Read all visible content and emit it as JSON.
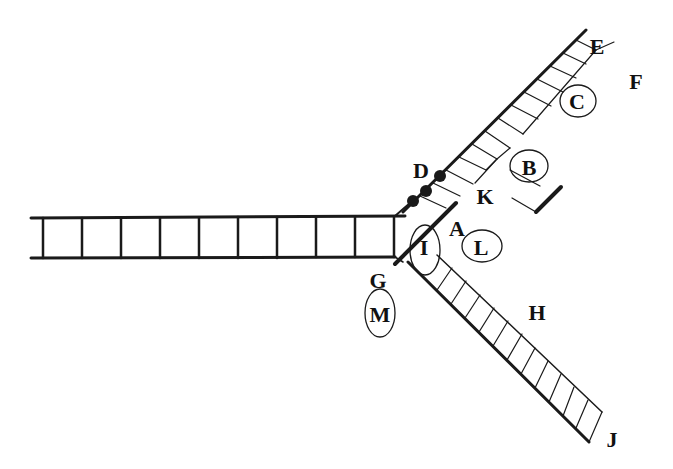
{
  "diagram": {
    "type": "Y-shaped structure diagram with three arms",
    "colors": {
      "line": "#1a1a1a",
      "background": "#ffffff"
    },
    "labels": [
      {
        "id": "A",
        "text": "A",
        "circled": false,
        "x": 457,
        "y": 232
      },
      {
        "id": "B",
        "text": "B",
        "circled": true,
        "x": 529,
        "y": 167
      },
      {
        "id": "C",
        "text": "C",
        "circled": true,
        "x": 577,
        "y": 100
      },
      {
        "id": "D",
        "text": "D",
        "circled": false,
        "x": 421,
        "y": 170
      },
      {
        "id": "E",
        "text": "E",
        "circled": false,
        "x": 596,
        "y": 46
      },
      {
        "id": "F",
        "text": "F",
        "circled": false,
        "x": 636,
        "y": 81
      },
      {
        "id": "G",
        "text": "G",
        "circled": false,
        "x": 377,
        "y": 281
      },
      {
        "id": "H",
        "text": "H",
        "circled": false,
        "x": 537,
        "y": 313
      },
      {
        "id": "I",
        "text": "I",
        "circled": true,
        "x": 424,
        "y": 248
      },
      {
        "id": "J",
        "text": "J",
        "circled": false,
        "x": 611,
        "y": 440
      },
      {
        "id": "K",
        "text": "K",
        "circled": false,
        "x": 484,
        "y": 197
      },
      {
        "id": "L",
        "text": "L",
        "circled": true,
        "x": 481,
        "y": 246
      },
      {
        "id": "M",
        "text": "M",
        "circled": true,
        "x": 379,
        "y": 315
      }
    ],
    "arms": [
      {
        "name": "left-horizontal-ladder",
        "rungs": 10
      },
      {
        "name": "upper-right-arm",
        "rungs": 14
      },
      {
        "name": "lower-right-hatched-arm",
        "rungs": 14
      }
    ],
    "dots": 3
  }
}
